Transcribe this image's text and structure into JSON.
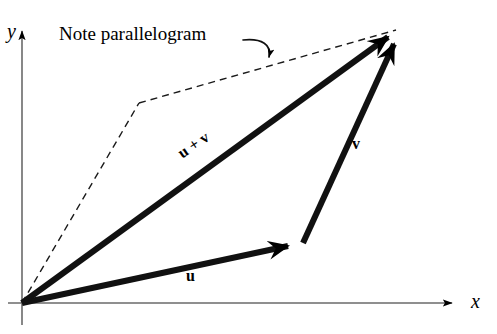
{
  "figure": {
    "kind": "vector-addition-parallelogram-diagram",
    "background_color": "#ffffff",
    "ink_color": "#000000",
    "annotation": {
      "note_text": "Note parallelogram"
    },
    "axes": {
      "x_label": "x",
      "y_label": "y",
      "origin": [
        22,
        303
      ],
      "x_axis_from": [
        8,
        303
      ],
      "x_axis_to": [
        455,
        303
      ],
      "y_axis_from": [
        22,
        325
      ],
      "y_axis_to": [
        22,
        28
      ],
      "stroke_width": 1.6,
      "arrowheads": [
        "x-positive",
        "y-positive"
      ]
    },
    "vectors": [
      {
        "name": "u",
        "label": "u",
        "from": [
          22,
          303
        ],
        "to": [
          302,
          243
        ],
        "style": "solid-bold",
        "stroke_width": 6,
        "label_position": [
          186,
          268
        ]
      },
      {
        "name": "v",
        "label": "v",
        "from": [
          302,
          243
        ],
        "to": [
          400,
          28
        ],
        "style": "solid-bold",
        "stroke_width": 6,
        "label_position": [
          352,
          136
        ]
      },
      {
        "name": "u_plus_v",
        "label": "u + v",
        "from": [
          22,
          303
        ],
        "to": [
          400,
          28
        ],
        "style": "solid-bold",
        "stroke_width": 6,
        "label_position": [
          175,
          148
        ],
        "label_rotation_deg": -34
      }
    ],
    "parallelogram": {
      "style": "dashed",
      "stroke_width": 1.4,
      "dash_pattern": "7,5",
      "points": [
        [
          22,
          303
        ],
        [
          139,
          103
        ],
        [
          400,
          28
        ]
      ],
      "description": "dashed copy of v from origin, then dashed copy of u to the tip"
    },
    "leader": {
      "style": "curved-arrow",
      "from": [
        243,
        40
      ],
      "to": [
        270,
        63
      ],
      "control": [
        272,
        40
      ],
      "stroke_width": 1.6
    }
  }
}
